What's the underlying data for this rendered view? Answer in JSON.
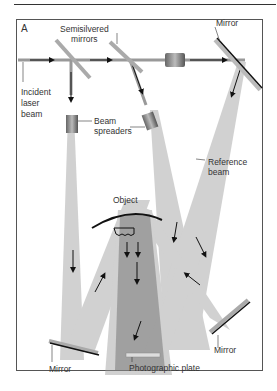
{
  "figure": {
    "panel_label": "A",
    "labels": {
      "semisilvered_mirrors": "Semisilvered\nmirrors",
      "mirror_top": "Mirror",
      "incident_laser_beam": "Incident\nlaser\nbeam",
      "beam_spreaders": "Beam\nspreaders",
      "reference_beam": "Reference\nbeam",
      "object": "Object",
      "mirror_left": "Mirror",
      "mirror_right": "Mirror",
      "photographic_plate": "Photographic plate"
    }
  }
}
